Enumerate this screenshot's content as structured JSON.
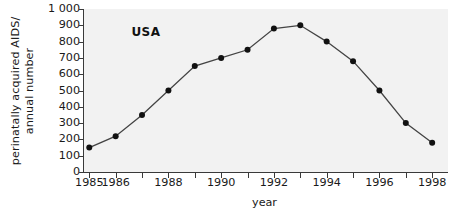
{
  "chart_data": {
    "type": "line",
    "title": "",
    "xlabel": "year",
    "ylabel": "perinatally acquired AIDS/ annual number",
    "ylabel_line1": "perinatally acquired AIDS/",
    "ylabel_line2": "annual number",
    "annotation": "USA",
    "x": [
      1985,
      1986,
      1987,
      1988,
      1989,
      1990,
      1991,
      1992,
      1993,
      1994,
      1995,
      1996,
      1997,
      1998
    ],
    "values": [
      150,
      220,
      350,
      500,
      650,
      700,
      750,
      880,
      900,
      800,
      680,
      500,
      300,
      180
    ],
    "xlim": [
      1984.8,
      1998.6
    ],
    "ylim": [
      0,
      1000
    ],
    "x_ticks": [
      1985,
      1986,
      1987,
      1988,
      1989,
      1990,
      1991,
      1992,
      1993,
      1994,
      1995,
      1996,
      1997,
      1998
    ],
    "x_tick_labels": [
      "1985",
      "1986",
      "",
      "1988",
      "",
      "1990",
      "",
      "1992",
      "",
      "1994",
      "",
      "1996",
      "",
      "1998"
    ],
    "y_ticks": [
      0,
      100,
      200,
      300,
      400,
      500,
      600,
      700,
      800,
      900,
      1000
    ],
    "y_tick_labels": [
      "0",
      "100",
      "200",
      "300",
      "400",
      "500",
      "600",
      "700",
      "800",
      "900",
      "1 000"
    ],
    "grid": false,
    "legend": "none",
    "marker": "filled-circle",
    "line_color": "#444444",
    "marker_color": "#111111",
    "plot_background": "#f2f2f2",
    "figure_background": "#ffffff"
  }
}
